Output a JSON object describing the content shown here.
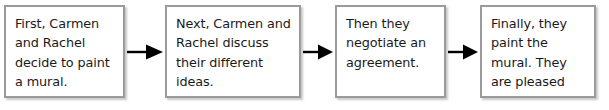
{
  "diagram": {
    "type": "sequence-flowchart",
    "title": "",
    "orientation": "horizontal-left-to-right",
    "colors": {
      "box_border": "#9a9a9a",
      "box_fill": "#ffffff",
      "text": "#1a1a1a",
      "arrow": "#000000",
      "page_background": "#ffffff"
    },
    "steps": [
      {
        "index": 1,
        "name": "step-first",
        "text": "First, Carmen and Rachel decide to paint a mural.",
        "lines": [
          "First, Carmen",
          "and Rachel",
          "decide to paint",
          "a mural."
        ]
      },
      {
        "index": 2,
        "name": "step-next",
        "text": "Next, Carmen and Rachel discuss their different ideas.",
        "lines": [
          "Next, Carmen",
          "and Rachel",
          "discuss their",
          "different ideas."
        ]
      },
      {
        "index": 3,
        "name": "step-then",
        "text": "Then they negotiate an agreement.",
        "lines": [
          "Then they",
          "negotiate an",
          "agreement."
        ]
      },
      {
        "index": 4,
        "name": "step-finally",
        "text": "Finally, they paint the mural. They are pleased with the results.",
        "lines": [
          "Finally, they",
          "paint the mural.",
          "They are pleased",
          "with the results."
        ]
      }
    ],
    "connectors": [
      {
        "name": "arrow-right-icon",
        "from": 1,
        "to": 2,
        "direction": "right"
      },
      {
        "name": "arrow-right-icon",
        "from": 2,
        "to": 3,
        "direction": "right"
      },
      {
        "name": "arrow-right-icon",
        "from": 3,
        "to": 4,
        "direction": "right"
      }
    ]
  }
}
